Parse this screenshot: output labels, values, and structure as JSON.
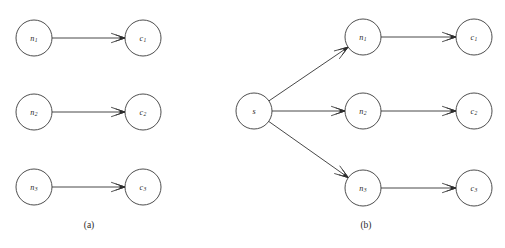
{
  "figure": {
    "width": 505,
    "height": 248,
    "background_color": "#ffffff",
    "stroke_color": "#333333",
    "label_color": "#2a2a2a",
    "node_radius": 18
  },
  "panels": [
    {
      "id": "panel-a",
      "caption": "(a)",
      "caption_pos": {
        "x": 89,
        "y": 228
      },
      "nodes": [
        {
          "id": "a-n1",
          "base": "n",
          "sub": "1",
          "label": "n1",
          "x": 34,
          "y": 38
        },
        {
          "id": "a-c1",
          "base": "c",
          "sub": "1",
          "label": "c1",
          "x": 143,
          "y": 38
        },
        {
          "id": "a-n2",
          "base": "n",
          "sub": "2",
          "label": "n2",
          "x": 34,
          "y": 112
        },
        {
          "id": "a-c2",
          "base": "c",
          "sub": "2",
          "label": "c2",
          "x": 143,
          "y": 112
        },
        {
          "id": "a-n3",
          "base": "n",
          "sub": "3",
          "label": "n3",
          "x": 34,
          "y": 187
        },
        {
          "id": "a-c3",
          "base": "c",
          "sub": "3",
          "label": "c3",
          "x": 143,
          "y": 187
        }
      ],
      "edges": [
        {
          "id": "a-e1",
          "from": "a-n1",
          "to": "a-c1",
          "directed": true
        },
        {
          "id": "a-e2",
          "from": "a-n2",
          "to": "a-c2",
          "directed": true
        },
        {
          "id": "a-e3",
          "from": "a-n3",
          "to": "a-c3",
          "directed": true
        }
      ]
    },
    {
      "id": "panel-b",
      "caption": "(b)",
      "caption_pos": {
        "x": 366,
        "y": 228
      },
      "nodes": [
        {
          "id": "b-s",
          "base": "s",
          "sub": "",
          "label": "s",
          "x": 254,
          "y": 111
        },
        {
          "id": "b-n1",
          "base": "n",
          "sub": "1",
          "label": "n1",
          "x": 363,
          "y": 37
        },
        {
          "id": "b-c1",
          "base": "c",
          "sub": "1",
          "label": "c1",
          "x": 474,
          "y": 37
        },
        {
          "id": "b-n2",
          "base": "n",
          "sub": "2",
          "label": "n2",
          "x": 363,
          "y": 111
        },
        {
          "id": "b-c2",
          "base": "c",
          "sub": "2",
          "label": "c2",
          "x": 474,
          "y": 111
        },
        {
          "id": "b-n3",
          "base": "n",
          "sub": "3",
          "label": "n3",
          "x": 363,
          "y": 188
        },
        {
          "id": "b-c3",
          "base": "c",
          "sub": "3",
          "label": "c3",
          "x": 474,
          "y": 188
        }
      ],
      "edges": [
        {
          "id": "b-e-s-n1",
          "from": "b-s",
          "to": "b-n1",
          "directed": true
        },
        {
          "id": "b-e-s-n2",
          "from": "b-s",
          "to": "b-n2",
          "directed": true
        },
        {
          "id": "b-e-s-n3",
          "from": "b-s",
          "to": "b-n3",
          "directed": true
        },
        {
          "id": "b-e-n1-c1",
          "from": "b-n1",
          "to": "b-c1",
          "directed": true
        },
        {
          "id": "b-e-n2-c2",
          "from": "b-n2",
          "to": "b-c2",
          "directed": true
        },
        {
          "id": "b-e-n3-c3",
          "from": "b-n3",
          "to": "b-c3",
          "directed": true
        }
      ]
    }
  ],
  "chart_data": {
    "type": "diagram",
    "title": "",
    "panel_a_edges": [
      [
        "n1",
        "c1"
      ],
      [
        "n2",
        "c2"
      ],
      [
        "n3",
        "c3"
      ]
    ],
    "panel_b_edges": [
      [
        "s",
        "n1"
      ],
      [
        "s",
        "n2"
      ],
      [
        "s",
        "n3"
      ],
      [
        "n1",
        "c1"
      ],
      [
        "n2",
        "c2"
      ],
      [
        "n3",
        "c3"
      ]
    ]
  }
}
